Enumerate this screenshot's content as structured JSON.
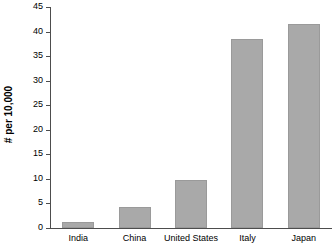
{
  "chart_data": {
    "type": "bar",
    "title": "",
    "xlabel": "",
    "ylabel": "# per 10,000",
    "categories": [
      "India",
      "China",
      "United States",
      "Italy",
      "Japan"
    ],
    "values": [
      1.2,
      4.3,
      9.7,
      38.5,
      41.5
    ],
    "ylim": [
      0,
      45
    ],
    "yticks": [
      0,
      5,
      10,
      15,
      20,
      25,
      30,
      35,
      40,
      45
    ],
    "ytick_labels": [
      "0",
      "5",
      "10",
      "15",
      "20",
      "25",
      "30",
      "35",
      "40",
      "45"
    ],
    "grid": false,
    "legend": null,
    "bar_color": "#a9a9a9",
    "axis_color": "#4d4d4d"
  }
}
